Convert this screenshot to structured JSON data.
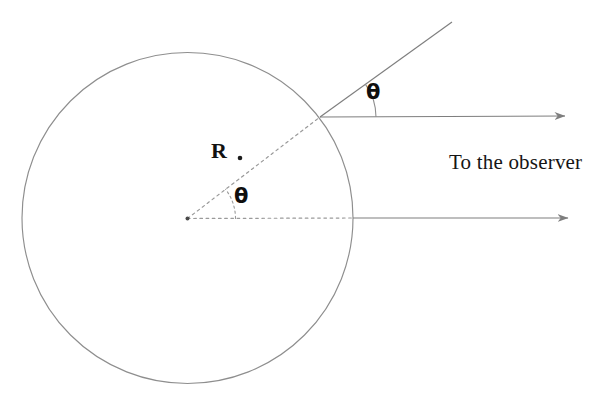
{
  "figure": {
    "title_text": "",
    "background_color": "#ffffff",
    "stroke_color": "#8a8a8a",
    "dotted_color": "#9a9a9a",
    "text_color": "#141414",
    "labels": {
      "radius": "R",
      "angle_center": "θ",
      "angle_surface": "θ",
      "observer": "To the observer"
    },
    "geometry": {
      "circle": {
        "name": "sphere-outline",
        "center_x": 187.5,
        "center_y": 218.0,
        "radius": 165.5
      },
      "center_point": {
        "name": "center-dot",
        "x": 187.5,
        "y": 218.5
      },
      "radius_end_point": {
        "name": "surface-point",
        "x": 320.0,
        "y": 117.0
      },
      "radius_label_dot": {
        "x": 240.0,
        "y": 158.0
      },
      "center_axis_dotted": {
        "x1": 187.5,
        "y1": 218.5,
        "x2": 353.0,
        "y2": 218.0
      },
      "lower_arrow": {
        "x1": 353.0,
        "y1": 218.0,
        "x2": 568.0,
        "y2": 218.0
      },
      "upper_arrow": {
        "x1": 320.0,
        "y1": 117.0,
        "x2": 565.0,
        "y2": 116.0
      },
      "surface_ray": {
        "x1": 320.0,
        "y1": 117.0,
        "x2": 452.0,
        "y2": 22.0,
        "angle_degrees": 35.7
      },
      "center_radius_angle_degrees": 37.4,
      "center_arc": {
        "radius": 48,
        "start_deg": 0,
        "end_deg": 37.4
      },
      "surface_arc": {
        "radius": 56,
        "start_deg": 0,
        "end_deg": 35.7
      }
    },
    "label_positions": {
      "radius": {
        "x": 211,
        "y": 140
      },
      "angle_center": {
        "x": 234,
        "y": 186
      },
      "angle_surface": {
        "x": 366,
        "y": 82
      },
      "observer": {
        "x": 449,
        "y": 152
      }
    }
  }
}
